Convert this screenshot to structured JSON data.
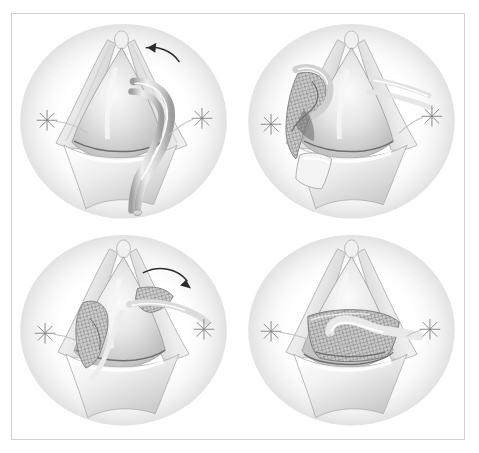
{
  "figure": {
    "style": "grayscale medical line-and-wash illustration",
    "panel_count": 4,
    "frame_color": "#d2d2d2",
    "background_color": "#ffffff",
    "margin_credit": "",
    "caption": ""
  },
  "palette": {
    "ink": "#8a8a8a",
    "ink_dark": "#5e5e5e",
    "outline": "#9a9a9a",
    "tissue_light": "#f2f2f2",
    "tissue_mid": "#d8d8d8",
    "tissue_shadow": "#b4b4b4",
    "mesh_line": "#8c8c8c",
    "mesh_fill": "#c9c9c9",
    "arrow": "#2b2b2b",
    "suture": "#7e7e7e",
    "frame": "#d2d2d2",
    "white_highlight": "#ffffff"
  },
  "panels": [
    {
      "id": "panel-1",
      "position": "top-left",
      "step_number": "1",
      "description": "Exposed conical tissue body held open by two retracted flaps with stay sutures at left and right; a looped passing instrument/catheter is introduced from the right side around the structure.",
      "has_arrow": true,
      "arrow_direction": "counterclockwise-left",
      "arrow_label": "rotate passer around structure",
      "has_mesh": false,
      "suture_marks": 2,
      "instruments": [
        "looped-passer",
        "catheter-loop"
      ]
    },
    {
      "id": "panel-2",
      "position": "top-right",
      "step_number": "2",
      "description": "Folded mesh graft attached to the passer at the left side, being drawn behind the tissue body; right-side flap retracted with encircling tape and stay suture.",
      "has_arrow": false,
      "arrow_direction": "",
      "arrow_label": "",
      "has_mesh": true,
      "mesh_state": "folded-loaded",
      "suture_marks": 2,
      "instruments": [
        "mesh-graft",
        "passer",
        "retraction-tape",
        "clamp-block"
      ]
    },
    {
      "id": "panel-3",
      "position": "bottom-left",
      "step_number": "3",
      "description": "Mesh graft advanced partway around the tissue body from the left; passer exits on the right carrying the graft edge forward.",
      "has_arrow": true,
      "arrow_direction": "clockwise-right",
      "arrow_label": "pull mesh across",
      "has_mesh": true,
      "mesh_state": "partially-deployed",
      "suture_marks": 2,
      "instruments": [
        "mesh-graft",
        "passer"
      ]
    },
    {
      "id": "panel-4",
      "position": "bottom-right",
      "step_number": "4",
      "description": "Mesh graft fully wrapped and seated circumferentially around the base of the tissue body; tape exits to the right stay suture.",
      "has_arrow": false,
      "arrow_direction": "",
      "arrow_label": "",
      "has_mesh": true,
      "mesh_state": "fully-deployed",
      "suture_marks": 2,
      "instruments": [
        "mesh-graft",
        "retraction-tape"
      ]
    }
  ]
}
